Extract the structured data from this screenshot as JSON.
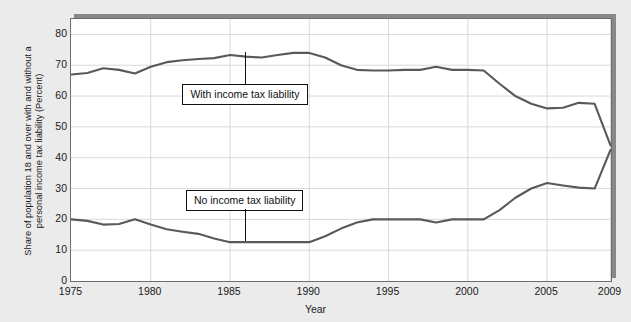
{
  "figure": {
    "title": "Share of population 18 and over with and without a personal income tax liability (Percent)",
    "background_color": "#ebebeb",
    "plot_background_color": "#ffffff",
    "line_color": "#595959",
    "gridline_color": "#d9d9d9",
    "axis_color": "#6e6e6e"
  },
  "chart_data": {
    "type": "line",
    "title": "",
    "xlabel": "Year",
    "ylabel": "Share of population 18 and over with and without a personal income tax liability (Percent)",
    "ylabel_line1": "Share of population 18 and over with and without a",
    "ylabel_line2": "personal income tax liability (Percent)",
    "xlim": [
      1975,
      2009
    ],
    "ylim": [
      0,
      85
    ],
    "yticks": [
      0,
      10,
      20,
      30,
      40,
      50,
      60,
      70,
      80
    ],
    "xticks": [
      1975,
      1980,
      1985,
      1990,
      1995,
      2000,
      2005,
      2009
    ],
    "xtick_labels": [
      "1975",
      "1980",
      "1985",
      "1990",
      "1995",
      "2000",
      "2005",
      "2009"
    ],
    "grid": true,
    "legend_position": "inline-callout",
    "x": [
      1975,
      1976,
      1977,
      1978,
      1979,
      1980,
      1981,
      1982,
      1983,
      1984,
      1985,
      1986,
      1987,
      1988,
      1989,
      1990,
      1991,
      1992,
      1993,
      1994,
      1995,
      1996,
      1997,
      1998,
      1999,
      2000,
      2001,
      2002,
      2003,
      2004,
      2005,
      2006,
      2007,
      2008,
      2009
    ],
    "series": [
      {
        "name": "With income tax liability",
        "label": "With income tax liability",
        "values": [
          67.0,
          67.5,
          69.0,
          68.5,
          67.3,
          69.5,
          71.0,
          71.6,
          72.0,
          72.3,
          73.3,
          72.8,
          72.5,
          73.3,
          74.0,
          74.0,
          72.5,
          70.0,
          68.5,
          68.3,
          68.3,
          68.5,
          68.5,
          69.5,
          68.5,
          68.5,
          68.3,
          64.0,
          60.0,
          57.5,
          56.0,
          56.2,
          57.8,
          57.5,
          44.0
        ]
      },
      {
        "name": "No income tax liability",
        "label": "No income tax liability",
        "values": [
          20.0,
          19.5,
          18.3,
          18.5,
          20.0,
          18.3,
          16.8,
          16.0,
          15.3,
          13.8,
          12.6,
          12.6,
          12.6,
          12.6,
          12.6,
          12.6,
          14.5,
          17.0,
          19.0,
          20.0,
          20.0,
          20.0,
          20.0,
          19.0,
          20.0,
          20.0,
          20.0,
          23.0,
          27.0,
          30.0,
          31.8,
          31.0,
          30.3,
          30.0,
          42.5
        ]
      }
    ],
    "annotations": [
      {
        "name": "with-income-tax-liability-callout",
        "text": "With income tax liability",
        "anchor_year": 1986,
        "anchor_value": 74.0
      },
      {
        "name": "no-income-tax-liability-callout",
        "text": "No income tax liability",
        "anchor_year": 1986,
        "anchor_value": 12.6
      }
    ]
  }
}
